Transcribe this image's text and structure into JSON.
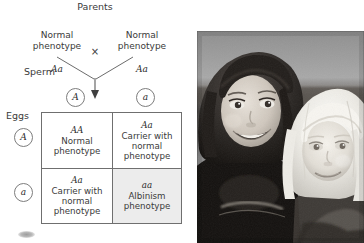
{
  "diagram": {
    "title": "Parents",
    "cross_symbol": "×",
    "parents": [
      {
        "phenotype": "Normal\nphenotype",
        "genotype": "Aa"
      },
      {
        "phenotype": "Normal\nphenotype",
        "genotype": "Aa"
      }
    ],
    "sperm_label": "Sperm",
    "eggs_label": "Eggs",
    "sperm_gametes": [
      "A",
      "a"
    ],
    "egg_gametes": [
      "A",
      "a"
    ],
    "punnett": {
      "cells": [
        [
          {
            "genotype": "AA",
            "description": "Normal\nphenotype",
            "shaded": false
          },
          {
            "genotype": "Aa",
            "description": "Carrier with\nnormal\nphenotype",
            "shaded": false
          }
        ],
        [
          {
            "genotype": "Aa",
            "description": "Carrier with\nnormal\nphenotype",
            "shaded": false
          },
          {
            "genotype": "aa",
            "description": "Albinism\nphenotype",
            "shaded": true
          }
        ]
      ]
    },
    "colors": {
      "shaded_cell": "#ececec",
      "border": "#6f6f6f",
      "text": "#3a3a3a"
    }
  },
  "photo": {
    "caption_alt": "Two young sisters, the younger with albinism (very pale hair and skin)",
    "style": "black-and-white photograph"
  }
}
